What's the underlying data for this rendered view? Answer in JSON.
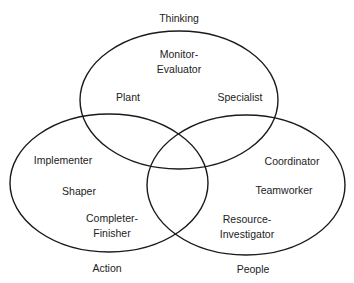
{
  "diagram": {
    "type": "venn",
    "sets": [
      {
        "name": "Thinking",
        "ellipse": {
          "cx": 179,
          "cy": 100,
          "rx": 99,
          "ry": 69
        },
        "label_pos": {
          "x": 179,
          "y": 22
        },
        "roles": [
          {
            "lines": [
              "Monitor-",
              "Evaluator"
            ],
            "x": 179,
            "y": 58
          },
          {
            "lines": [
              "Plant"
            ],
            "x": 128,
            "y": 101
          },
          {
            "lines": [
              "Specialist"
            ],
            "x": 239,
            "y": 101
          }
        ]
      },
      {
        "name": "Action",
        "ellipse": {
          "cx": 109,
          "cy": 183,
          "rx": 99,
          "ry": 69
        },
        "label_pos": {
          "x": 107,
          "y": 271
        },
        "roles": [
          {
            "lines": [
              "Implementer"
            ],
            "x": 63,
            "y": 164
          },
          {
            "lines": [
              "Shaper"
            ],
            "x": 79,
            "y": 195
          },
          {
            "lines": [
              "Completer-",
              "Finisher"
            ],
            "x": 112,
            "y": 222
          }
        ]
      },
      {
        "name": "People",
        "ellipse": {
          "cx": 246,
          "cy": 185,
          "rx": 99,
          "ry": 70
        },
        "label_pos": {
          "x": 253,
          "y": 272
        },
        "roles": [
          {
            "lines": [
              "Coordinator"
            ],
            "x": 292,
            "y": 165
          },
          {
            "lines": [
              "Teamworker"
            ],
            "x": 284,
            "y": 195
          },
          {
            "lines": [
              "Resource-",
              "Investigator"
            ],
            "x": 247,
            "y": 223
          }
        ]
      }
    ],
    "colors": {
      "stroke": "#1a1a1a",
      "text": "#222222",
      "background": "#ffffff"
    }
  },
  "labels": {
    "thinking": "Thinking",
    "action": "Action",
    "people": "People",
    "monitor_1": "Monitor-",
    "monitor_2": "Evaluator",
    "plant": "Plant",
    "specialist": "Specialist",
    "implementer": "Implementer",
    "shaper": "Shaper",
    "completer_1": "Completer-",
    "completer_2": "Finisher",
    "coordinator": "Coordinator",
    "teamworker": "Teamworker",
    "resource_1": "Resource-",
    "resource_2": "Investigator"
  }
}
